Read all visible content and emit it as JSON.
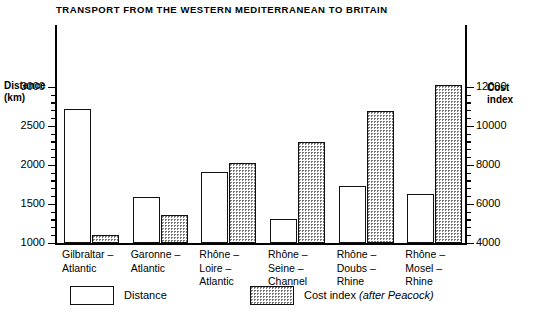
{
  "chart_data": {
    "type": "bar",
    "title": "TRANSPORT FROM THE WESTERN MEDITERRANEAN TO BRITAIN",
    "xlabel": "",
    "categories": [
      "Gilbraltar –\nAtlantic",
      "Garonne –\nAtlantic",
      "Rhône –\nLoire –\nAtlantic",
      "Rhône –\nSeine –\nChannel",
      "Rhône –\nDoubs –\nRhine",
      "Rhône –\nMosel –\nRhine"
    ],
    "series": [
      {
        "name": "Distance",
        "axis": "left",
        "values": [
          2720,
          1600,
          1920,
          1310,
          1730,
          1640
        ]
      },
      {
        "name": "Cost index",
        "axis": "right",
        "values": [
          4450,
          5480,
          8130,
          9200,
          10800,
          12100
        ]
      }
    ],
    "left_axis": {
      "label": "Distance\n(km)",
      "label_line1": "Distance",
      "label_line2": "(km)",
      "ylim": [
        1000,
        3000
      ],
      "ticks": [
        1000,
        1500,
        2000,
        2500,
        3000
      ],
      "tick_labels": [
        "1000",
        "1500",
        "2000",
        "2500",
        "3000"
      ],
      "minor_step": 100
    },
    "right_axis": {
      "label": "Cost\nindex",
      "label_line1": "Cost",
      "label_line2": "index",
      "ylim": [
        4000,
        12000
      ],
      "ticks": [
        4000,
        6000,
        8000,
        10000,
        12000
      ],
      "tick_labels": [
        "4000",
        "6000",
        "8000",
        "10000",
        "12000"
      ],
      "minor_step": 400
    },
    "grid": false,
    "legend_position": "bottom",
    "legend": [
      {
        "label": "Distance",
        "fill": "white"
      },
      {
        "label": "Cost index",
        "note": "(after Peacock)",
        "fill": "dotted"
      }
    ],
    "colors": {
      "distance_fill": "#ffffff",
      "cost_fill": "#b8b8b8",
      "outline": "#111111",
      "background": "#ffffff"
    }
  }
}
